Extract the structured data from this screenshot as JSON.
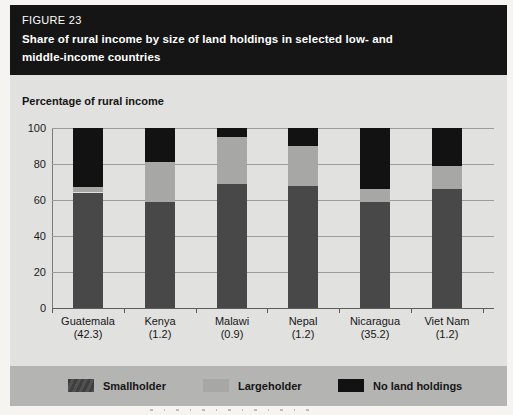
{
  "figure": {
    "label": "FIGURE 23",
    "title_lines": [
      "Share of rural income by size of land holdings in selected low- and",
      "middle-income countries"
    ]
  },
  "axis_title": "Percentage of rural income",
  "chart_data": {
    "type": "bar",
    "stacked": true,
    "title": "Share of rural income by size of land holdings in selected low- and middle-income countries",
    "ylabel": "Percentage of rural income",
    "ylim": [
      0,
      100
    ],
    "yticks": [
      0,
      20,
      40,
      60,
      80,
      100
    ],
    "grid": true,
    "legend_position": "bottom",
    "categories": [
      "Guatemala",
      "Kenya",
      "Malawi",
      "Nepal",
      "Nicaragua",
      "Viet Nam"
    ],
    "category_sublabels": [
      "(42.3)",
      "(1.2)",
      "(0.9)",
      "(1.2)",
      "(35.2)",
      "(1.2)"
    ],
    "series": [
      {
        "name": "Smallholder",
        "color": "#484848",
        "values": [
          64,
          59,
          69,
          68,
          59,
          66
        ]
      },
      {
        "name": "Largeholder",
        "color": "#a7a7a6",
        "values": [
          3,
          22,
          26,
          22,
          7,
          13
        ]
      },
      {
        "name": "No land holdings",
        "color": "#121212",
        "values": [
          33,
          19,
          5,
          10,
          34,
          21
        ]
      }
    ]
  },
  "legend": {
    "items": [
      {
        "label": "Smallholder",
        "color": "#484848"
      },
      {
        "label": "Largeholder",
        "color": "#a7a7a6"
      },
      {
        "label": "No land holdings",
        "color": "#121212"
      }
    ]
  },
  "colors": {
    "header_bg": "#151515",
    "header_text": "#ffffff",
    "figure_bg": "#e1e1e0",
    "legend_band": "#b4b4b3",
    "gridline": "#9b9b9b"
  }
}
